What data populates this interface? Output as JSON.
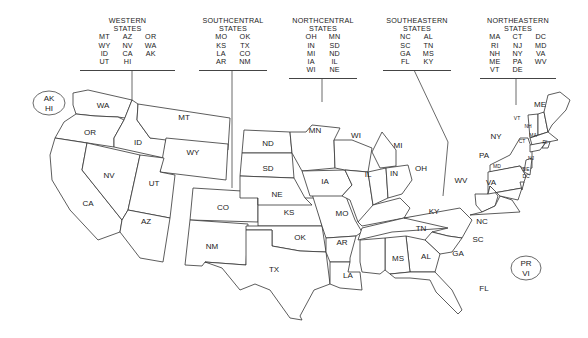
{
  "regions": [
    {
      "id": "western",
      "title_line1": "WESTERN",
      "title_line2": "STATES",
      "columns": [
        [
          "MT",
          "WY",
          "ID",
          "UT"
        ],
        [
          "AZ",
          "NV",
          "CA",
          "HI"
        ],
        [
          "OR",
          "WA",
          "AK"
        ]
      ]
    },
    {
      "id": "southcentral",
      "title_line1": "SOUTHCENTRAL",
      "title_line2": "STATES",
      "columns": [
        [
          "MO",
          "KS",
          "LA",
          "AR"
        ],
        [
          "OK",
          "TX",
          "CO",
          "NM"
        ]
      ]
    },
    {
      "id": "northcentral",
      "title_line1": "NORTHCENTRAL",
      "title_line2": "STATES",
      "columns": [
        [
          "OH",
          "IN",
          "MI",
          "IA",
          "WI"
        ],
        [
          "MN",
          "SD",
          "ND",
          "IL",
          "NE"
        ]
      ]
    },
    {
      "id": "southeastern",
      "title_line1": "SOUTHEASTERN",
      "title_line2": "STATES",
      "columns": [
        [
          "NC",
          "SC",
          "GA",
          "FL"
        ],
        [
          "AL",
          "TN",
          "MS",
          "KY"
        ]
      ]
    },
    {
      "id": "northeastern",
      "title_line1": "NORTHEASTERN",
      "title_line2": "STATES",
      "columns": [
        [
          "MA",
          "RI",
          "NH",
          "ME",
          "VT"
        ],
        [
          "CT",
          "NJ",
          "NY",
          "PA",
          "DE"
        ],
        [
          "DC",
          "MD",
          "VA",
          "WV"
        ]
      ]
    }
  ],
  "ovals": {
    "ak_hi": {
      "line1": "AK",
      "line2": "HI"
    },
    "pr_vi": {
      "line1": "PR",
      "line2": "VI"
    }
  },
  "state_labels": {
    "WA": "WA",
    "OR": "OR",
    "CA": "CA",
    "NV": "NV",
    "ID": "ID",
    "MT": "MT",
    "WY": "WY",
    "UT": "UT",
    "AZ": "AZ",
    "CO": "CO",
    "NM": "NM",
    "KS": "KS",
    "OK": "OK",
    "TX": "TX",
    "MO": "MO",
    "AR": "AR",
    "LA": "LA",
    "ND": "ND",
    "SD": "SD",
    "NE": "NE",
    "MN": "MN",
    "IA": "IA",
    "WI": "WI",
    "IL": "IL",
    "MI": "MI",
    "IN": "IN",
    "OH": "OH",
    "KY": "KY",
    "TN": "TN",
    "NC": "NC",
    "SC": "SC",
    "GA": "GA",
    "AL": "AL",
    "MS": "MS",
    "FL": "FL",
    "ME": "ME",
    "VT": "VT",
    "NH": "NH",
    "MA": "MA",
    "RI": "RI",
    "CT": "CT",
    "NY": "NY",
    "NJ": "NJ",
    "PA": "PA",
    "DE": "DE",
    "MD": "MD",
    "DC": "DC",
    "VA": "VA",
    "WV": "WV"
  },
  "colors": {
    "line": "#333333",
    "text": "#222222",
    "background": "#ffffff"
  }
}
